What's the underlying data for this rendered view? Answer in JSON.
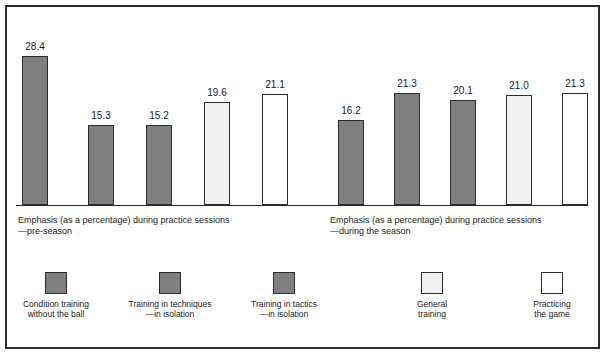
{
  "chart_data": {
    "type": "bar",
    "title": "",
    "subtitle": "",
    "xlabel": "",
    "ylabel": "",
    "ylim": [
      0,
      30
    ],
    "grid": false,
    "legend_position": "bottom",
    "categories": [
      "Condition training without the ball",
      "Training in techniques —in isolation",
      "Training in tactics —in isolation",
      "General training",
      "Practicing the game"
    ],
    "groups": [
      {
        "caption_line1": "Emphasis (as a percentage) during practice sessions",
        "caption_line2": "—pre-season",
        "values": [
          28.4,
          15.3,
          15.2,
          19.6,
          21.1
        ],
        "labels": [
          "28.4",
          "15.3",
          "15.2",
          "19.6",
          "21.1"
        ]
      },
      {
        "caption_line1": "Emphasis (as a percentage) during practice sessions",
        "caption_line2": "—during the season",
        "values": [
          16.2,
          21.3,
          20.1,
          21.0,
          21.3
        ],
        "labels": [
          "16.2",
          "21.3",
          "20.1",
          "21.0",
          "21.3"
        ]
      }
    ],
    "series_colors": [
      "#808080",
      "#808080",
      "#808080",
      "#f0f0f0",
      "#ffffff"
    ],
    "bar_outline_color": "#2b2b2b"
  },
  "legend": {
    "items": [
      {
        "label": "Condition training\nwithout the ball",
        "color": "#808080"
      },
      {
        "label": "Training in techniques\n—in isolation",
        "color": "#808080"
      },
      {
        "label": "Training in tactics\n—in isolation",
        "color": "#808080"
      },
      {
        "label": "General\ntraining",
        "color": "#f0f0f0"
      },
      {
        "label": "Practicing\nthe game",
        "color": "#ffffff"
      }
    ]
  },
  "captions": {
    "group1": "Emphasis (as a percentage) during practice sessions\n—pre-season",
    "group2": "Emphasis (as a percentage) during practice sessions\n—during the season"
  }
}
